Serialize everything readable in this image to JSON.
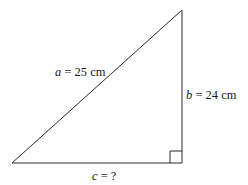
{
  "diagram": {
    "type": "right-triangle",
    "colors": {
      "stroke": "#2a2a2a",
      "text": "#1a1a1a",
      "background": "#ffffff"
    },
    "vertices": {
      "bottom_left": [
        12,
        163
      ],
      "bottom_right": [
        182,
        163
      ],
      "top": [
        182,
        10
      ]
    },
    "right_angle_marker": {
      "x": 170,
      "y": 151,
      "size": 12
    },
    "labels": {
      "a": {
        "var": "a",
        "text": " = 25 cm",
        "side": "hypotenuse"
      },
      "b": {
        "var": "b",
        "text": " = 24 cm",
        "side": "vertical leg"
      },
      "c": {
        "var": "c",
        "text": " = ?",
        "side": "horizontal leg"
      }
    }
  }
}
